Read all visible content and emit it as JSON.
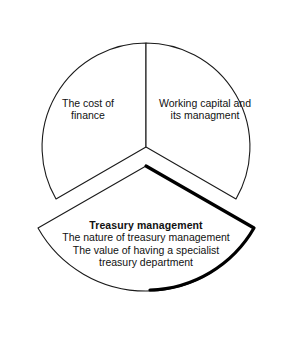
{
  "diagram": {
    "type": "exploded-pie",
    "shape": "circle divided into three equal sectors, bottom sector pulled out and emphasised",
    "background_color": "#ffffff",
    "line_color": "#1a1a1a",
    "emphasis_color": "#000000",
    "sectors": [
      {
        "id": "cost-of-finance",
        "position": "upper-left",
        "start_angle_deg": 210,
        "end_angle_deg": 330,
        "exploded": false,
        "emphasised": false,
        "lines": [
          "The cost of",
          "finance"
        ]
      },
      {
        "id": "working-capital",
        "position": "upper-right",
        "start_angle_deg": 330,
        "end_angle_deg": 90,
        "exploded": false,
        "emphasised": false,
        "lines": [
          "Working capital and",
          "its managment"
        ]
      },
      {
        "id": "treasury-management",
        "position": "bottom",
        "start_angle_deg": 90,
        "end_angle_deg": 210,
        "exploded": true,
        "emphasised": true,
        "heading": "Treasury management",
        "lines": [
          "The nature of treasury management",
          "The value of having a specialist",
          "treasury department"
        ]
      }
    ]
  }
}
